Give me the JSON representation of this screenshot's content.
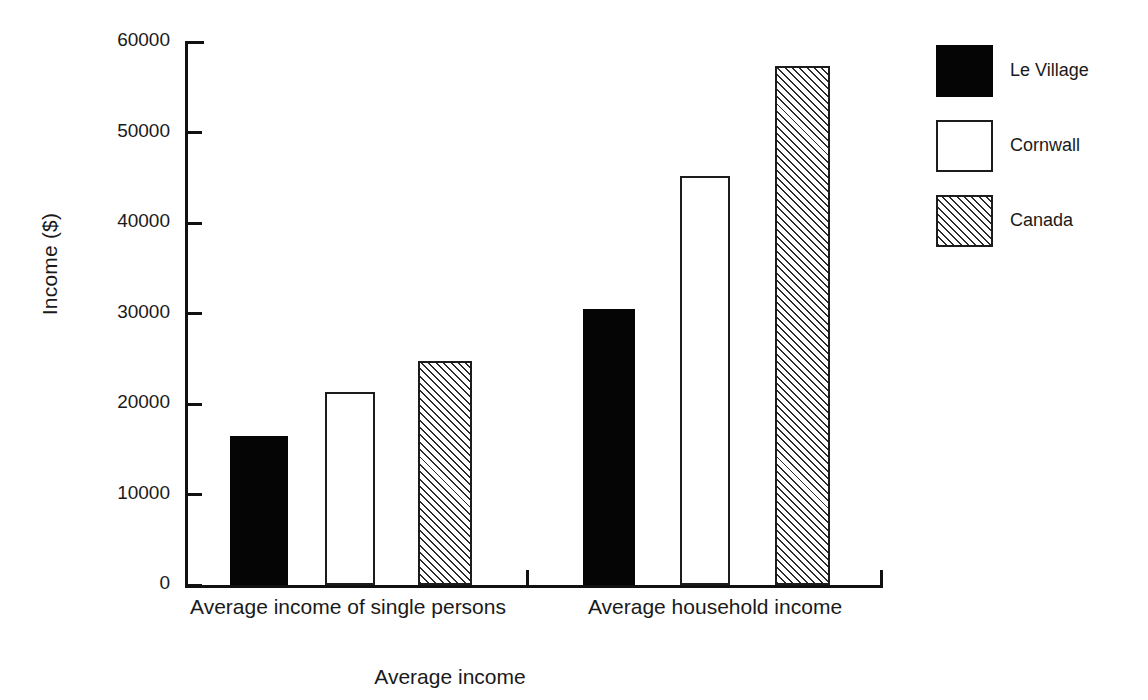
{
  "chart_data": {
    "type": "bar",
    "title": "",
    "xlabel": "Average income",
    "ylabel": "Income ($)",
    "categories": [
      "Average income of single persons",
      "Average household income"
    ],
    "series": [
      {
        "name": "Le Village",
        "values": [
          16500,
          30500
        ],
        "fill": "solid",
        "color": "#050505"
      },
      {
        "name": "Cornwall",
        "values": [
          21300,
          45200
        ],
        "fill": "open",
        "color": "#ffffff"
      },
      {
        "name": "Canada",
        "values": [
          24800,
          57400
        ],
        "fill": "hatch",
        "color": "#ffffff"
      }
    ],
    "ylim": [
      0,
      60000
    ],
    "yticks": [
      0,
      10000,
      20000,
      30000,
      40000,
      50000,
      60000
    ],
    "ytick_labels": [
      "0",
      "10000",
      "20000",
      "30000",
      "40000",
      "50000",
      "60000"
    ],
    "grid": false,
    "legend_position": "right",
    "axis_color": "#111111"
  },
  "legend": {
    "items": [
      {
        "label": "Le Village",
        "fill": "solid"
      },
      {
        "label": "Cornwall",
        "fill": "open"
      },
      {
        "label": "Canada",
        "fill": "hatch"
      }
    ]
  },
  "axes": {
    "y_title": "Income ($)",
    "x_title": "Average income"
  }
}
